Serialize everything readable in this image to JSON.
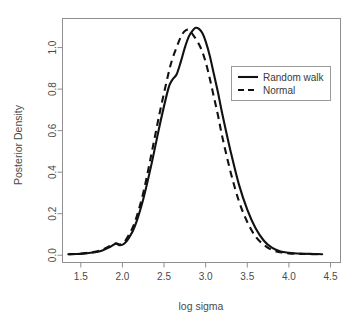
{
  "chart_data": {
    "type": "line",
    "title": "",
    "xlabel": "log sigma",
    "ylabel": "Posterior Density",
    "xlim": [
      1.28,
      4.62
    ],
    "ylim": [
      -0.035,
      1.14
    ],
    "xticks": [
      "1.5",
      "2.0",
      "2.5",
      "3.0",
      "3.5",
      "4.0",
      "4.5"
    ],
    "xtick_values": [
      1.5,
      2.0,
      2.5,
      3.0,
      3.5,
      4.0,
      4.5
    ],
    "yticks": [
      "0.0",
      "0.2",
      "0.4",
      "0.6",
      "0.8",
      "1.0"
    ],
    "ytick_values": [
      0.0,
      0.2,
      0.4,
      0.6,
      0.8,
      1.0
    ],
    "grid": false,
    "legend_position": "upper-right",
    "series": [
      {
        "name": "Random walk",
        "style": "solid",
        "color": "#111111",
        "x": [
          1.35,
          1.45,
          1.55,
          1.65,
          1.75,
          1.85,
          1.92,
          1.97,
          2.02,
          2.08,
          2.15,
          2.25,
          2.35,
          2.45,
          2.55,
          2.6,
          2.65,
          2.7,
          2.75,
          2.8,
          2.85,
          2.88,
          2.92,
          2.96,
          3.0,
          3.05,
          3.1,
          3.15,
          3.2,
          3.3,
          3.4,
          3.5,
          3.6,
          3.7,
          3.8,
          3.9,
          4.0,
          4.1,
          4.2,
          4.3,
          4.4
        ],
        "y": [
          0.005,
          0.006,
          0.009,
          0.013,
          0.022,
          0.04,
          0.055,
          0.048,
          0.055,
          0.085,
          0.14,
          0.27,
          0.44,
          0.63,
          0.8,
          0.845,
          0.87,
          0.93,
          1.0,
          1.055,
          1.085,
          1.095,
          1.09,
          1.07,
          1.03,
          0.96,
          0.87,
          0.78,
          0.68,
          0.5,
          0.34,
          0.22,
          0.13,
          0.07,
          0.035,
          0.018,
          0.012,
          0.008,
          0.007,
          0.006,
          0.005
        ]
      },
      {
        "name": "Normal",
        "style": "dashed",
        "color": "#111111",
        "x": [
          1.35,
          1.45,
          1.55,
          1.65,
          1.75,
          1.85,
          1.92,
          1.97,
          2.02,
          2.08,
          2.15,
          2.25,
          2.35,
          2.45,
          2.55,
          2.6,
          2.65,
          2.7,
          2.75,
          2.8,
          2.85,
          2.9,
          2.95,
          3.0,
          3.05,
          3.1,
          3.15,
          3.2,
          3.3,
          3.4,
          3.5,
          3.6,
          3.7,
          3.8,
          3.9,
          4.0,
          4.1,
          4.2,
          4.3,
          4.4
        ],
        "y": [
          0.005,
          0.006,
          0.01,
          0.015,
          0.026,
          0.045,
          0.057,
          0.052,
          0.062,
          0.1,
          0.16,
          0.3,
          0.49,
          0.69,
          0.87,
          0.945,
          1.0,
          1.05,
          1.08,
          1.085,
          1.06,
          1.03,
          0.99,
          0.93,
          0.85,
          0.76,
          0.67,
          0.57,
          0.4,
          0.26,
          0.16,
          0.09,
          0.05,
          0.025,
          0.014,
          0.009,
          0.007,
          0.006,
          0.005,
          0.005
        ]
      }
    ]
  },
  "legend": {
    "items": [
      {
        "label": "Random walk",
        "style": "solid"
      },
      {
        "label": "Normal",
        "style": "dashed"
      }
    ]
  }
}
